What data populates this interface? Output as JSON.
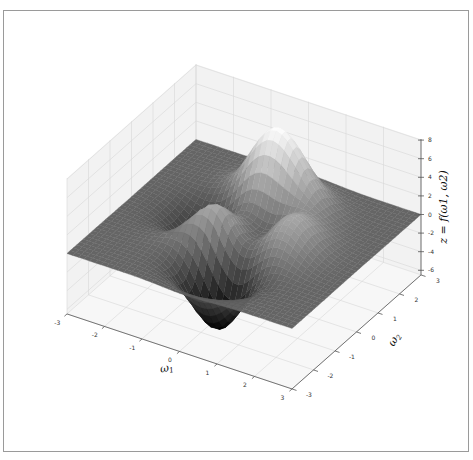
{
  "chart_data": {
    "type": "surface3d",
    "title": "",
    "function": "peaks",
    "formula": "z = 3(1-x)^2 e^{-x^2-(y+1)^2} - 10(x/5 - x^3 - y^5) e^{-x^2-y^2} - 1/3 e^{-(x+1)^2-y^2}",
    "xlabel": "ω1",
    "ylabel": "ω2",
    "zlabel": "z = f(ω1, ω2)",
    "xlim": [
      -3,
      3
    ],
    "ylim": [
      -3,
      3
    ],
    "zlim": [
      -6.5,
      8.1
    ],
    "x_ticks": [
      -3,
      -2,
      -1,
      0,
      1,
      2,
      3
    ],
    "y_ticks": [
      -3,
      -2,
      -1,
      0,
      1,
      2,
      3
    ],
    "z_ticks": [
      -6,
      -4,
      -2,
      0,
      2,
      4,
      6,
      8
    ],
    "grid": true,
    "colormap": "gray",
    "grid_resolution": 40,
    "features": {
      "global_max": {
        "x": -0.01,
        "y": 1.58,
        "z": 8.1
      },
      "global_min": {
        "x": 0.23,
        "y": -1.63,
        "z": -6.55
      },
      "local_max_1": {
        "x": -0.46,
        "y": -0.63,
        "z": 3.78
      },
      "local_max_2": {
        "x": 1.29,
        "y": -0.0,
        "z": 3.59
      }
    }
  },
  "labels": {
    "x_axis": "ω",
    "x_sub": "1",
    "y_axis": "ω",
    "y_sub": "2",
    "z_axis": "z = f(ω1, ω2)"
  },
  "colors": {
    "frame": "#9a9a9a",
    "pane": "#f2f2f2",
    "grid": "#d6d6d6",
    "axis": "#555555",
    "surface_low": "#000000",
    "surface_high": "#ffffff"
  }
}
